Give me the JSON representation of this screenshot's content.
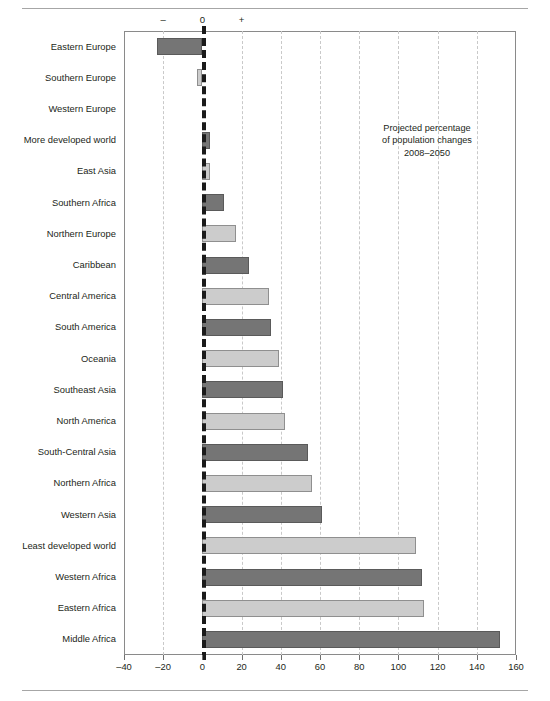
{
  "figure": {
    "annotation_lines": [
      "Projected percentage",
      "of population changes",
      "2008–2050"
    ],
    "sign_marks": {
      "negative": "–",
      "zero": "0",
      "positive": "+"
    }
  },
  "chart_data": {
    "type": "bar",
    "orientation": "horizontal",
    "title": "",
    "subtitle": "",
    "xlabel": "",
    "ylabel": "",
    "xlim": [
      -40,
      160
    ],
    "xticks": [
      -40,
      -20,
      0,
      20,
      40,
      60,
      80,
      100,
      120,
      140,
      160
    ],
    "xticklabels": [
      "–40",
      "–20",
      "0",
      "20",
      "40",
      "60",
      "80",
      "100",
      "120",
      "140",
      "160"
    ],
    "grid": true,
    "grid_axis": "x",
    "legend": null,
    "annotations": [
      "Projected percentage of population changes 2008–2050"
    ],
    "bar_colors": {
      "dark": "#757575",
      "light": "#cccccc"
    },
    "categories": [
      "Eastern Europe",
      "Southern Europe",
      "Western Europe",
      "More developed world",
      "East Asia",
      "Southern Africa",
      "Northern Europe",
      "Caribbean",
      "Central America",
      "South America",
      "Oceania",
      "Southeast Asia",
      "North America",
      "South-Central Asia",
      "Northern Africa",
      "Western Asia",
      "Least developed world",
      "Western Africa",
      "Eastern Africa",
      "Middle Africa"
    ],
    "values": [
      -23,
      -3,
      0,
      4,
      4,
      11,
      17,
      24,
      34,
      35,
      39,
      41,
      42,
      54,
      56,
      61,
      109,
      112,
      113,
      152
    ],
    "shades": [
      "dark",
      "light",
      "dark",
      "dark",
      "light",
      "dark",
      "light",
      "dark",
      "light",
      "dark",
      "light",
      "dark",
      "light",
      "dark",
      "light",
      "dark",
      "light",
      "dark",
      "light",
      "dark"
    ]
  }
}
